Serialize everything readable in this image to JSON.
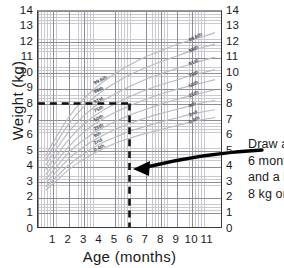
{
  "chart_data": {
    "type": "line",
    "title": "",
    "xlabel": "Age (months)",
    "ylabel": "Weight (kg)",
    "xlim": [
      0,
      12
    ],
    "ylim": [
      0,
      14
    ],
    "grid": true,
    "x_ticks": [
      "1",
      "2",
      "3",
      "4",
      "5",
      "6",
      "7",
      "8",
      "9",
      "10",
      "11"
    ],
    "y_ticks": [
      "14",
      "13",
      "12",
      "11",
      "10",
      "9",
      "8",
      "7",
      "6",
      "5",
      "4",
      "3",
      "2",
      "1",
      "0"
    ],
    "y_ticks_right": [
      "14",
      "13",
      "12",
      "11",
      "10",
      "9",
      "8",
      "7",
      "6",
      "5",
      "4",
      "3",
      "2",
      "1",
      "0"
    ],
    "legend_position": "inline-on-curves",
    "series": [
      {
        "name": "99.6th",
        "x": [
          0.5,
          1,
          2,
          3,
          4,
          5,
          6,
          7,
          8,
          9,
          10,
          11,
          11.6
        ],
        "values": [
          4.6,
          5.5,
          7.1,
          8.3,
          9.2,
          9.9,
          10.5,
          11.0,
          11.4,
          11.8,
          12.1,
          12.4,
          12.6
        ]
      },
      {
        "name": "98th",
        "x": [
          0.5,
          1,
          2,
          3,
          4,
          5,
          6,
          7,
          8,
          9,
          10,
          11,
          11.6
        ],
        "values": [
          4.35,
          5.15,
          6.65,
          7.8,
          8.65,
          9.3,
          9.85,
          10.3,
          10.7,
          11.05,
          11.4,
          11.7,
          11.85
        ]
      },
      {
        "name": "91st",
        "x": [
          0.5,
          1,
          2,
          3,
          4,
          5,
          6,
          7,
          8,
          9,
          10,
          11,
          11.6
        ],
        "values": [
          4.0,
          4.75,
          6.15,
          7.2,
          8.0,
          8.6,
          9.1,
          9.55,
          9.9,
          10.25,
          10.55,
          10.85,
          11.0
        ]
      },
      {
        "name": "75th",
        "x": [
          0.5,
          1,
          2,
          3,
          4,
          5,
          6,
          7,
          8,
          9,
          10,
          11,
          11.6
        ],
        "values": [
          3.7,
          4.35,
          5.65,
          6.65,
          7.4,
          7.95,
          8.45,
          8.85,
          9.2,
          9.5,
          9.8,
          10.05,
          10.2
        ]
      },
      {
        "name": "50th",
        "x": [
          0.5,
          1,
          2,
          3,
          4,
          5,
          6,
          7,
          8,
          9,
          10,
          11,
          11.6
        ],
        "values": [
          3.4,
          4.0,
          5.2,
          6.15,
          6.85,
          7.4,
          7.85,
          8.25,
          8.6,
          8.9,
          9.15,
          9.4,
          9.55
        ]
      },
      {
        "name": "25th",
        "x": [
          0.5,
          1,
          2,
          3,
          4,
          5,
          6,
          7,
          8,
          9,
          10,
          11,
          11.6
        ],
        "values": [
          3.1,
          3.65,
          4.8,
          5.65,
          6.3,
          6.8,
          7.25,
          7.6,
          7.95,
          8.25,
          8.5,
          8.75,
          8.9
        ]
      },
      {
        "name": "9th",
        "x": [
          0.5,
          1,
          2,
          3,
          4,
          5,
          6,
          7,
          8,
          9,
          10,
          11,
          11.6
        ],
        "values": [
          2.85,
          3.35,
          4.4,
          5.2,
          5.8,
          6.3,
          6.7,
          7.05,
          7.35,
          7.6,
          7.85,
          8.1,
          8.2
        ]
      },
      {
        "name": "2nd",
        "x": [
          0.5,
          1,
          2,
          3,
          4,
          5,
          6,
          7,
          8,
          9,
          10,
          11,
          11.6
        ],
        "values": [
          2.6,
          3.05,
          4.0,
          4.75,
          5.35,
          5.8,
          6.2,
          6.5,
          6.8,
          7.05,
          7.3,
          7.5,
          7.6
        ]
      },
      {
        "name": "0.4th",
        "x": [
          0.5,
          1,
          2,
          3,
          4,
          5,
          6,
          7,
          8,
          9,
          10,
          11,
          11.6
        ],
        "values": [
          2.4,
          2.8,
          3.7,
          4.4,
          4.95,
          5.4,
          5.75,
          6.05,
          6.3,
          6.55,
          6.8,
          7.0,
          7.1
        ]
      }
    ],
    "annotations": [
      {
        "name": "weight-guide-line",
        "type": "horizontal-dashed",
        "value": 8,
        "label": "8 kg"
      },
      {
        "name": "age-guide-line",
        "type": "vertical-dashed",
        "value": 6,
        "label": "6 months"
      },
      {
        "name": "callout-arrow",
        "type": "curved-arrow",
        "points_to_x": 6,
        "points_to_y": 4
      }
    ]
  },
  "axes": {
    "y_title": "Weight (kg)",
    "x_title": "Age (months)",
    "y_ticks_left": [
      "14",
      "13",
      "12",
      "11",
      "10",
      "9",
      "8",
      "7",
      "6",
      "5",
      "4",
      "3",
      "2",
      "1",
      "0"
    ],
    "y_ticks_right": [
      "14",
      "13",
      "12",
      "11",
      "10",
      "9",
      "8",
      "7",
      "6",
      "5",
      "4",
      "3",
      "2",
      "1",
      "0"
    ],
    "x_ticks": [
      "1",
      "2",
      "3",
      "4",
      "5",
      "6",
      "7",
      "8",
      "9",
      "10",
      "11"
    ]
  },
  "percentile_labels_left": [
    "99.6th",
    "98th",
    "91st",
    "75th",
    "50th",
    "25th",
    "9th",
    "2nd",
    "0.4th"
  ],
  "percentile_labels_right": [
    "99.6th",
    "98th",
    "91st",
    "75th",
    "50th",
    "25th",
    "9th",
    "2nd",
    "0.4th"
  ],
  "annotation_text": {
    "line1": "Draw a",
    "line2": "6 mont",
    "line3": "and a l",
    "line4": "8 kg or"
  },
  "colors": {
    "curve": "#b9b9c2",
    "grid_minor": "#c9c9cf",
    "grid_major": "#8d8d96",
    "axis": "#3a3a3a",
    "guide_line": "#111111",
    "arrow": "#000000",
    "text": "#1a1a1a",
    "background": "#ffffff"
  }
}
